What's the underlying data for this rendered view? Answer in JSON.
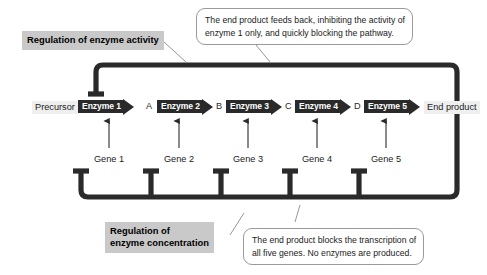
{
  "figure": {
    "pathway": {
      "start_label": "Precursor",
      "end_label": "End product",
      "enzymes": [
        {
          "label": "Enzyme 1"
        },
        {
          "label": "Enzyme 2"
        },
        {
          "label": "Enzyme 3"
        },
        {
          "label": "Enzyme 4"
        },
        {
          "label": "Enzyme 5"
        }
      ],
      "intermediates": [
        "A",
        "B",
        "C",
        "D"
      ]
    },
    "genes": [
      {
        "label": "Gene 1"
      },
      {
        "label": "Gene 2"
      },
      {
        "label": "Gene 3"
      },
      {
        "label": "Gene 4"
      },
      {
        "label": "Gene 5"
      }
    ],
    "annotations": {
      "enzyme_activity": "Regulation of enzyme activity",
      "enzyme_concentration_line1": "Regulation of",
      "enzyme_concentration_line2": "enzyme concentration"
    },
    "callouts": {
      "top_line1": "The end product feeds back, inhibiting the activity of",
      "top_line2": "enzyme 1 only, and quickly blocking the pathway.",
      "bottom_line1": "The end product blocks the transcription of",
      "bottom_line2": "all five genes. No enzymes are produced."
    },
    "colors": {
      "pathway_stroke": "#2a2a2a",
      "enzyme_fill": "#2a2a2a",
      "enzyme_text": "#ffffff",
      "annotation_background": "#c9c9c9",
      "chip_background": "#efefef",
      "callout_border": "#9a9a9a",
      "leader_line": "#8a8a8a",
      "background": "#ffffff"
    }
  }
}
